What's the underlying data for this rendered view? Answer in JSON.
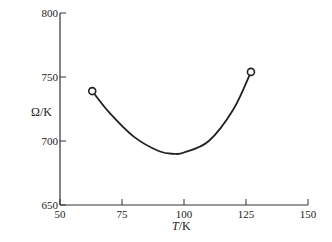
{
  "chart_data": {
    "type": "line",
    "title": "",
    "xlabel": "T/K",
    "ylabel": "Ω/K",
    "xlim": [
      50,
      150
    ],
    "ylim": [
      650,
      800
    ],
    "xticks": [
      "50",
      "75",
      "100",
      "125",
      "150"
    ],
    "yticks": [
      "650",
      "700",
      "750",
      "800"
    ],
    "grid": false,
    "legend": null,
    "series": [
      {
        "name": "Ω vs T",
        "x": [
          63,
          70,
          80,
          90,
          96,
          100,
          110,
          120,
          127
        ],
        "y": [
          739,
          722,
          703,
          692,
          690,
          691,
          700,
          725,
          754
        ]
      }
    ],
    "annotations": [
      {
        "type": "open-circle",
        "x": 63,
        "y": 739
      },
      {
        "type": "open-circle",
        "x": 127,
        "y": 754
      }
    ]
  },
  "axes": {
    "x_label_italic": "T",
    "x_label_unit": "/K",
    "y_label": "Ω/K"
  }
}
